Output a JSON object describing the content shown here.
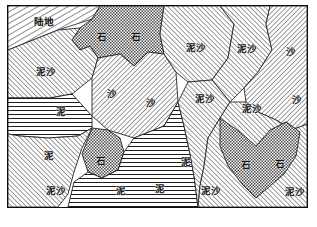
{
  "figure": {
    "kind": "sediment-distribution-map",
    "frame": {
      "x": 7,
      "y": 5,
      "width": 301,
      "height": 203,
      "border_color": "#0e0e0e"
    },
    "legend_terms": {
      "land": "陆地",
      "rock": "石",
      "sand": "沙",
      "mud": "泥",
      "mud_sand": "泥沙"
    },
    "patterns": {
      "land_hatch": {
        "name": "diagonal-hatch-steep",
        "ink": "#1a1a1a"
      },
      "sand_hatch": {
        "name": "diagonal-hatch-right",
        "ink": "#2b2b2b"
      },
      "mud_sand_hatch": {
        "name": "diagonal-hatch-left",
        "ink": "#2b2b2b"
      },
      "mud_lines": {
        "name": "horizontal-lines",
        "ink": "#1e1e1e"
      },
      "rock_dots": {
        "name": "checker-dots",
        "ink": "#3a3a3a"
      }
    }
  },
  "labels": [
    {
      "id": "land-top-left",
      "text": "陆地",
      "x": 36,
      "y": 16
    },
    {
      "id": "rock-top-a",
      "text": "石",
      "x": 94,
      "y": 31
    },
    {
      "id": "rock-top-b",
      "text": "石",
      "x": 128,
      "y": 31
    },
    {
      "id": "mudsand-top-a",
      "text": "泥沙",
      "x": 188,
      "y": 42
    },
    {
      "id": "mudsand-top-b",
      "text": "泥沙",
      "x": 239,
      "y": 43
    },
    {
      "id": "sand-top-right",
      "text": "沙",
      "x": 283,
      "y": 46
    },
    {
      "id": "mudsand-left-upper",
      "text": "泥沙",
      "x": 38,
      "y": 66
    },
    {
      "id": "sand-center-left",
      "text": "沙",
      "x": 104,
      "y": 88
    },
    {
      "id": "sand-center",
      "text": "沙",
      "x": 143,
      "y": 97
    },
    {
      "id": "mudsand-mid",
      "text": "泥沙",
      "x": 197,
      "y": 93
    },
    {
      "id": "mudsand-mid-right",
      "text": "泥沙",
      "x": 244,
      "y": 103
    },
    {
      "id": "sand-right-mid",
      "text": "沙",
      "x": 289,
      "y": 94
    },
    {
      "id": "mud-left-upper",
      "text": "泥",
      "x": 53,
      "y": 106
    },
    {
      "id": "mud-left-lower",
      "text": "泥",
      "x": 41,
      "y": 150
    },
    {
      "id": "rock-mid-left",
      "text": "石",
      "x": 93,
      "y": 155
    },
    {
      "id": "mud-bottom-center",
      "text": "泥",
      "x": 113,
      "y": 185
    },
    {
      "id": "mud-bottom-right",
      "text": "泥",
      "x": 152,
      "y": 183
    },
    {
      "id": "mud-right-edge",
      "text": "泥",
      "x": 178,
      "y": 156
    },
    {
      "id": "mudsand-bottom-left",
      "text": "泥沙",
      "x": 48,
      "y": 185
    },
    {
      "id": "mudsand-bottom-mid",
      "text": "泥沙",
      "x": 203,
      "y": 185
    },
    {
      "id": "rock-bottom-a",
      "text": "石",
      "x": 238,
      "y": 159
    },
    {
      "id": "rock-bottom-b",
      "text": "石",
      "x": 272,
      "y": 158
    },
    {
      "id": "mudsand-bottom-rt",
      "text": "泥沙",
      "x": 287,
      "y": 186
    }
  ],
  "regions": [
    {
      "id": "region-land",
      "material": "陆地",
      "pattern": "land_hatch"
    },
    {
      "id": "region-rock-top",
      "material": "石",
      "pattern": "rock_dots"
    },
    {
      "id": "region-mudsand-upleft",
      "material": "泥沙",
      "pattern": "mud_sand_hatch"
    },
    {
      "id": "region-sand-center",
      "material": "沙",
      "pattern": "sand_hatch"
    },
    {
      "id": "region-mudsand-topmid",
      "material": "泥沙",
      "pattern": "mud_sand_hatch"
    },
    {
      "id": "region-mudsand-topright",
      "material": "泥沙",
      "pattern": "mud_sand_hatch"
    },
    {
      "id": "region-sand-right",
      "material": "沙",
      "pattern": "sand_hatch"
    },
    {
      "id": "region-mud-left",
      "material": "泥",
      "pattern": "mud_lines"
    },
    {
      "id": "region-mudsand-botleft",
      "material": "泥沙",
      "pattern": "mud_sand_hatch"
    },
    {
      "id": "region-rock-midleft",
      "material": "石",
      "pattern": "rock_dots"
    },
    {
      "id": "region-mud-bottom",
      "material": "泥",
      "pattern": "mud_lines"
    },
    {
      "id": "region-mudsand-botmid",
      "material": "泥沙",
      "pattern": "mud_sand_hatch"
    },
    {
      "id": "region-rock-heart",
      "material": "石",
      "pattern": "rock_dots"
    },
    {
      "id": "region-mudsand-botright",
      "material": "泥沙",
      "pattern": "mud_sand_hatch"
    }
  ]
}
